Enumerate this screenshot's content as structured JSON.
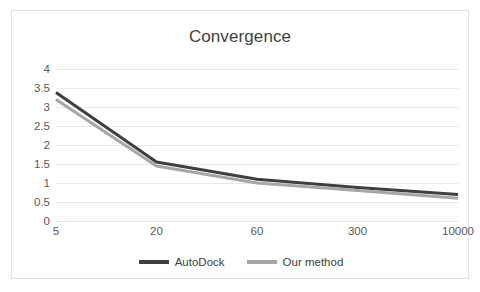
{
  "chart_data": {
    "type": "line",
    "title": "Convergence",
    "xlabel": "",
    "ylabel": "",
    "categories": [
      "5",
      "20",
      "60",
      "300",
      "10000"
    ],
    "ylim": [
      0,
      4
    ],
    "yticks": [
      "0",
      "0.5",
      "1",
      "1.5",
      "2",
      "2.5",
      "3",
      "3.5",
      "4"
    ],
    "ytick_values": [
      0,
      0.5,
      1,
      1.5,
      2,
      2.5,
      3,
      3.5,
      4
    ],
    "grid": true,
    "legend_position": "bottom",
    "series": [
      {
        "name": "AutoDock",
        "color": "#3f3f3f",
        "values": [
          3.38,
          1.55,
          1.1,
          0.88,
          0.7
        ]
      },
      {
        "name": "Our method",
        "color": "#a6a6a6",
        "values": [
          3.2,
          1.45,
          1.0,
          0.8,
          0.6
        ]
      }
    ]
  },
  "colors": {
    "frame_border": "#e2e2e2",
    "gridline": "#e8e8e8",
    "title_text": "#3f3f3f",
    "tick_text": "#595959",
    "background": "#ffffff"
  }
}
